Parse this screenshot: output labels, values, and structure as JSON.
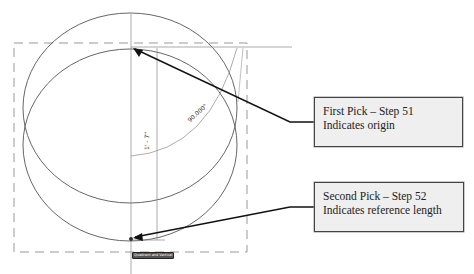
{
  "diagram": {
    "dimension_length": "1' - 7\"",
    "dimension_angle": "90.000°",
    "snap_tooltip": "Quadrant and Vertical",
    "colors": {
      "geometry": "#555555",
      "dashed_boundary": "#888888",
      "arrow": "#111111",
      "callout_fill": "#efefef",
      "callout_border": "#444444"
    }
  },
  "callouts": [
    {
      "line1": "First Pick – Step 51",
      "line2": "Indicates origin"
    },
    {
      "line1": "Second Pick – Step 52",
      "line2": "Indicates reference length"
    }
  ]
}
